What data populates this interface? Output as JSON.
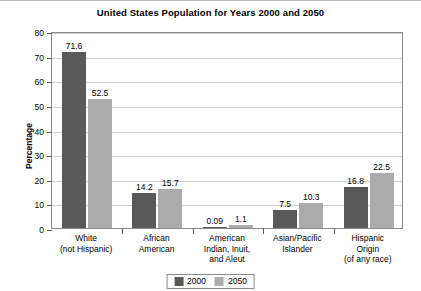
{
  "chart_data": {
    "type": "bar",
    "title": "United States Population for Years 2000 and 2050",
    "xlabel": "",
    "ylabel": "Percentage",
    "ylim": [
      0,
      80
    ],
    "yticks": [
      0,
      10,
      20,
      30,
      40,
      50,
      60,
      70,
      80
    ],
    "grid": true,
    "legend_position": "bottom-center",
    "categories": [
      "White\n(not Hispanic)",
      "African\nAmerican",
      "American\nIndian, Inuit,\nand Aleut",
      "Asian/Pacific\nIslander",
      "Hispanic\nOrigin\n(of any race)"
    ],
    "category_lines": [
      [
        "White",
        "(not Hispanic)"
      ],
      [
        "African",
        "American"
      ],
      [
        "American",
        "Indian, Inuit,",
        "and Aleut"
      ],
      [
        "Asian/Pacific",
        "Islander"
      ],
      [
        "Hispanic",
        "Origin",
        "(of any race)"
      ]
    ],
    "series": [
      {
        "name": "2000",
        "color": "#595959",
        "values": [
          71.6,
          14.2,
          0.09,
          7.5,
          16.8
        ],
        "labels": [
          "71.6",
          "14.2",
          "0.09",
          "7.5",
          "16.8"
        ]
      },
      {
        "name": "2050",
        "color": "#ababab",
        "values": [
          52.5,
          15.7,
          1.1,
          10.3,
          22.5
        ],
        "labels": [
          "52.5",
          "15.7",
          "1.1",
          "10.3",
          "22.5"
        ]
      }
    ]
  },
  "legend": {
    "items": [
      {
        "label": "2000",
        "color": "#595959"
      },
      {
        "label": "2050",
        "color": "#ababab"
      }
    ]
  }
}
